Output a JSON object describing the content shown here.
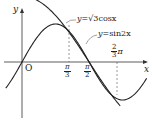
{
  "diagram": {
    "axes": {
      "x_label": "x",
      "y_label": "y",
      "origin_label": "O"
    },
    "curves": [
      {
        "name": "sqrt3-cos",
        "label": "y=√3cosx",
        "label_prefix": "y=",
        "label_body": "√3cosx"
      },
      {
        "name": "sin2x",
        "label": "y=sin2x",
        "label_prefix": "y=",
        "label_body": "sin2x"
      }
    ],
    "ticks": [
      {
        "num": "π",
        "den": "3",
        "value": "π/3"
      },
      {
        "num": "π",
        "den": "2",
        "value": "π/2"
      },
      {
        "num": "2",
        "den": "3",
        "suffix": "π",
        "value": "2π/3"
      }
    ]
  }
}
